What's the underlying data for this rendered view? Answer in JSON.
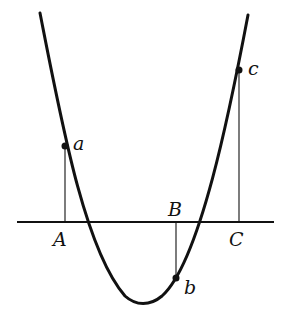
{
  "diagram": {
    "colors": {
      "ink": "#111111",
      "background": "#ffffff"
    },
    "axis": {
      "x1": 17,
      "x2": 274,
      "y": 222
    },
    "points": [
      {
        "curve_label": "a",
        "axis_label": "A",
        "x": 65,
        "y": 146
      },
      {
        "curve_label": "b",
        "axis_label": "B",
        "x": 176,
        "y": 278
      },
      {
        "curve_label": "c",
        "axis_label": "C",
        "x": 239,
        "y": 70
      }
    ],
    "labels": {
      "a": "a",
      "b": "b",
      "c": "c",
      "A": "A",
      "B": "B",
      "C": "C"
    }
  }
}
